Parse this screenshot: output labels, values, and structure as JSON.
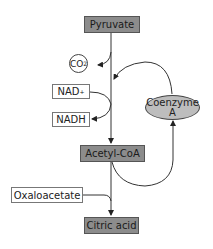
{
  "diagram": {
    "nodes": {
      "pyruvate": "Pyruvate",
      "co2": "CO",
      "co2_sub": "2",
      "nad_plus": "NAD",
      "nad_plus_sup": "+",
      "nadh": "NADH",
      "coenzyme_a_line1": "Coenzyme",
      "coenzyme_a_line2": "A",
      "acetyl_coa": "Acetyl-CoA",
      "oxaloacetate": "Oxaloacetate",
      "citric_acid": "Citric acid"
    },
    "colors": {
      "main_box_fill": "#8c8c8c",
      "side_box_fill": "#ffffff",
      "coenzyme_fill": "#bdbdbd",
      "line": "#333333"
    },
    "edges": [
      {
        "from": "Pyruvate",
        "to": "Acetyl-CoA"
      },
      {
        "from": "Pyruvate",
        "to": "CO2"
      },
      {
        "from": "NAD+",
        "to": "NADH"
      },
      {
        "from": "Coenzyme A",
        "to": "Acetyl-CoA pathway"
      },
      {
        "from": "Acetyl-CoA",
        "to": "Coenzyme A"
      },
      {
        "from": "Acetyl-CoA",
        "to": "Citric acid"
      },
      {
        "from": "Oxaloacetate",
        "to": "Citric acid"
      }
    ]
  }
}
